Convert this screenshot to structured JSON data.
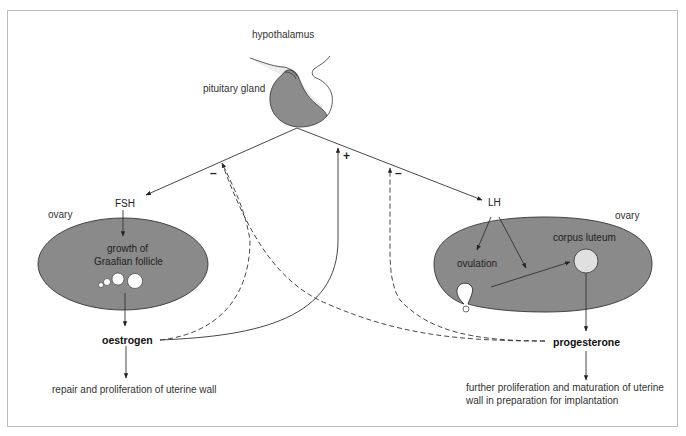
{
  "diagram": {
    "labels": {
      "hypothalamus": "hypothalamus",
      "pituitary_gland": "pituitary gland",
      "fsh": "FSH",
      "lh": "LH",
      "ovary_left": "ovary",
      "ovary_right": "ovary",
      "graafian_line1": "growth of",
      "graafian_line2": "Graafian follicle",
      "ovulation": "ovulation",
      "corpus_luteum": "corpus luteum",
      "oestrogen": "oestrogen",
      "progesterone": "progesterone",
      "oestrogen_effect": "repair and proliferation of uterine wall",
      "progesterone_effect_line1": "further proliferation and maturation of uterine",
      "progesterone_effect_line2": "wall in preparation for implantation"
    },
    "feedback_signs": {
      "oestrogen_to_fsh": "–",
      "oestrogen_to_lh": "+",
      "progesterone_to_lh": "–"
    },
    "colors": {
      "ovary_fill": "#8a8a8a",
      "pituitary_dark": "#8c8c8c",
      "pituitary_light": "#ececec",
      "structure_white": "#ffffff",
      "corpus_luteum_fill": "#e0e0e0",
      "line": "#333333",
      "frame": "#bdbdbd"
    }
  }
}
